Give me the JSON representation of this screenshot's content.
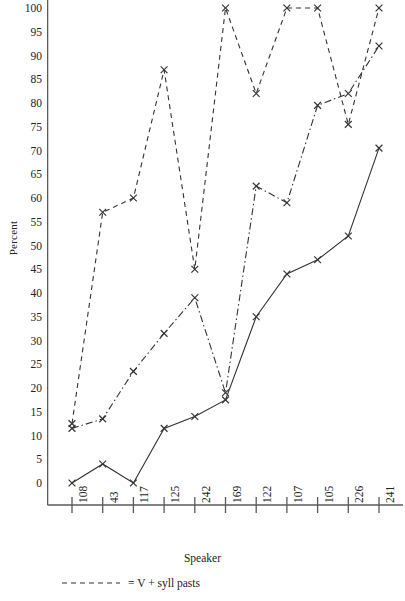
{
  "chart_data": {
    "type": "line",
    "title": "",
    "xlabel": "Speaker",
    "ylabel": "Percent",
    "categories": [
      "108",
      "43",
      "117",
      "125",
      "242",
      "169",
      "122",
      "107",
      "105",
      "226",
      "241"
    ],
    "ylim": [
      0,
      100
    ],
    "yticks": [
      0,
      5,
      10,
      15,
      20,
      25,
      30,
      35,
      40,
      45,
      50,
      55,
      60,
      65,
      70,
      75,
      80,
      85,
      90,
      95,
      100
    ],
    "grid": false,
    "marker": "x",
    "legend_position": "below-plot",
    "series": [
      {
        "name": "V + syll pasts",
        "linestyle": "dashed",
        "color": "#333333",
        "values": [
          12.5,
          57,
          60,
          87,
          45,
          100,
          82,
          100,
          100,
          75.5,
          100
        ]
      },
      {
        "name": "",
        "linestyle": "dash-dot",
        "color": "#333333",
        "values": [
          11.5,
          13.5,
          23.5,
          31.5,
          39,
          19,
          62.5,
          59,
          79.5,
          82,
          92
        ]
      },
      {
        "name": "",
        "linestyle": "solid",
        "color": "#333333",
        "values": [
          0,
          4,
          0,
          11.5,
          14,
          17.5,
          35,
          44,
          47,
          52,
          70.5
        ]
      }
    ]
  },
  "axes": {
    "y_title": "Percent",
    "x_title": "Speaker"
  },
  "legend": {
    "items": [
      {
        "marker_style": "dashed",
        "equals": "=",
        "label": "V + syll pasts"
      }
    ]
  }
}
